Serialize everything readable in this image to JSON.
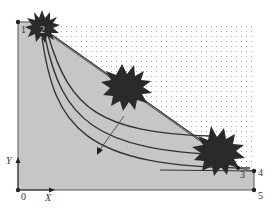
{
  "diagram": {
    "type": "phase/state region diagram",
    "colors": {
      "region_fill": "#c6c6c6",
      "dot_color": "#9a9a9a",
      "line_color": "#333333",
      "starburst_color": "#2a2a2a",
      "background": "#ffffff"
    },
    "points": [
      {
        "id": "0",
        "label": "0",
        "x": 18,
        "y": 190
      },
      {
        "id": "1",
        "label": "1",
        "x": 18,
        "y": 22
      },
      {
        "id": "2",
        "label": "2",
        "x": 42,
        "y": 28
      },
      {
        "id": "3",
        "label": "3",
        "x": 238,
        "y": 168
      },
      {
        "id": "4",
        "label": "4",
        "x": 254,
        "y": 171
      },
      {
        "id": "5",
        "label": "5",
        "x": 254,
        "y": 190
      }
    ],
    "axes": {
      "x_label": "X",
      "y_label": "Y"
    },
    "curves_count": 3,
    "arrow": {
      "from": [
        124,
        116
      ],
      "to": [
        97,
        154
      ]
    },
    "starbursts": [
      {
        "name": "starburst-top-left",
        "cx": 42,
        "cy": 27,
        "r": 16
      },
      {
        "name": "starburst-middle",
        "cx": 125,
        "cy": 86,
        "r": 20
      },
      {
        "name": "starburst-bottom-right",
        "cx": 215,
        "cy": 150,
        "r": 22
      }
    ]
  }
}
